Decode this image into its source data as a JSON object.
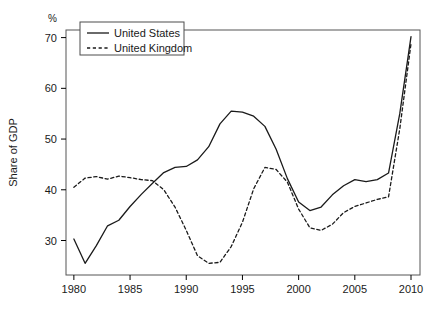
{
  "chart_data": {
    "type": "line",
    "title": "",
    "subtitle": "",
    "xlabel": "",
    "ylabel": "Share of GDP",
    "unit_label": "%",
    "xlim": [
      1979.3,
      2010.8
    ],
    "ylim": [
      23.2,
      71.5
    ],
    "grid": false,
    "legend_position": "top-left",
    "x_ticks": [
      1980,
      1985,
      1990,
      1995,
      2000,
      2005,
      2010
    ],
    "x_tick_labels": [
      "1980",
      "1985",
      "1990",
      "1995",
      "2000",
      "2005",
      "2010"
    ],
    "y_ticks": [
      30,
      40,
      50,
      60,
      70
    ],
    "y_tick_labels": [
      "30",
      "40",
      "50",
      "60",
      "70"
    ],
    "x": [
      1980,
      1981,
      1982,
      1983,
      1984,
      1985,
      1986,
      1987,
      1988,
      1989,
      1990,
      1991,
      1992,
      1993,
      1994,
      1995,
      1996,
      1997,
      1998,
      1999,
      2000,
      2001,
      2002,
      2003,
      2004,
      2005,
      2006,
      2007,
      2008,
      2009,
      2010
    ],
    "series": [
      {
        "name": "United States",
        "style": "solid",
        "color": "#1a1a1a",
        "values": [
          30.3,
          25.5,
          29.0,
          32.9,
          34.0,
          36.7,
          39.1,
          41.3,
          43.4,
          44.4,
          44.6,
          45.9,
          48.5,
          53.0,
          55.5,
          55.3,
          54.5,
          52.5,
          48.0,
          42.2,
          37.6,
          35.9,
          36.6,
          39.0,
          40.8,
          42.0,
          41.6,
          42.0,
          43.3,
          55.0,
          70.2
        ]
      },
      {
        "name": "United Kingdom",
        "style": "dashed",
        "color": "#1a1a1a",
        "values": [
          40.5,
          42.3,
          42.6,
          42.1,
          42.7,
          42.4,
          42.0,
          41.8,
          40.0,
          36.6,
          32.0,
          27.0,
          25.5,
          25.7,
          28.8,
          33.6,
          40.2,
          44.4,
          44.0,
          41.5,
          36.2,
          32.5,
          32.0,
          33.2,
          35.5,
          36.7,
          37.4,
          38.1,
          38.6,
          52.0,
          68.8
        ]
      }
    ]
  },
  "legend": {
    "items": [
      {
        "label": "United States",
        "style": "solid"
      },
      {
        "label": "United Kingdom",
        "style": "dashed"
      }
    ]
  },
  "axes": {
    "y_axis_title": "Share of GDP",
    "y_unit": "%"
  }
}
